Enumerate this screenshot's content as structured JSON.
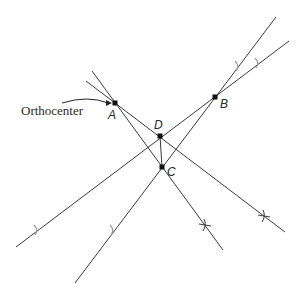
{
  "figure": {
    "annotation": "Orthocenter",
    "colors": {
      "line": "#3a3a3a",
      "tick_light": "#9a9a9a",
      "tick_dark": "#3a3a3a",
      "point": "#111111",
      "background": "#ffffff"
    },
    "points": [
      {
        "id": "A",
        "label": "A",
        "x": 115,
        "y": 103,
        "label_x": 108,
        "label_y": 119
      },
      {
        "id": "B",
        "label": "B",
        "x": 215,
        "y": 97,
        "label_x": 220,
        "label_y": 108
      },
      {
        "id": "D",
        "label": "D",
        "x": 160,
        "y": 136,
        "label_x": 154,
        "label_y": 129
      },
      {
        "id": "C",
        "label": "C",
        "x": 162,
        "y": 167,
        "label_x": 167,
        "label_y": 176
      }
    ],
    "lines": [
      {
        "id": "line-a-c",
        "x1": 92,
        "y1": 71,
        "x2": 223,
        "y2": 250
      },
      {
        "id": "line-a-d",
        "x1": 86,
        "y1": 81,
        "x2": 285,
        "y2": 232
      },
      {
        "id": "line-b-d",
        "x1": 289,
        "y1": 41,
        "x2": 16,
        "y2": 247
      },
      {
        "id": "line-b-c",
        "x1": 276,
        "y1": 17,
        "x2": 75,
        "y2": 283
      },
      {
        "id": "segment-d-c",
        "x1": 160,
        "y1": 136,
        "x2": 162,
        "y2": 167
      }
    ],
    "ticks": [
      {
        "id": "tick-b-c-upper",
        "x": 238,
        "y": 66,
        "tone": "light",
        "style": "arc"
      },
      {
        "id": "tick-b-d-upper",
        "x": 258,
        "y": 63,
        "tone": "light",
        "style": "arc"
      },
      {
        "id": "tick-b-d-lower",
        "x": 37,
        "y": 230,
        "tone": "light",
        "style": "arc"
      },
      {
        "id": "tick-b-c-lower",
        "x": 113,
        "y": 230,
        "tone": "light",
        "style": "arc"
      },
      {
        "id": "tick-a-c-lower",
        "x": 205,
        "y": 225,
        "tone": "dark",
        "style": "cross"
      },
      {
        "id": "tick-a-d-lower",
        "x": 264,
        "y": 216,
        "tone": "dark",
        "style": "cross"
      }
    ],
    "arrow": {
      "from_x": 62,
      "from_y": 103,
      "ctrl_x": 88,
      "ctrl_y": 95,
      "to_x": 112,
      "to_y": 103
    }
  }
}
